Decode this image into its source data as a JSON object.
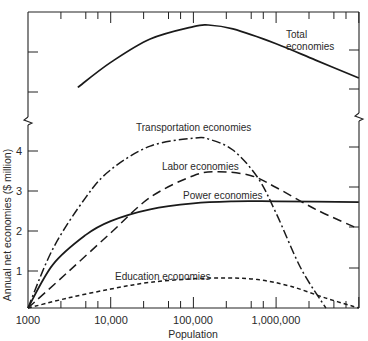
{
  "chart_data": {
    "type": "line",
    "title": "",
    "xlabel": "Population",
    "ylabel": "Annual net economies ($ million)",
    "x_scale": "log",
    "xlim": [
      1000,
      10000000
    ],
    "ylim": [
      0,
      4.5
    ],
    "x_ticks": [
      {
        "value": 1000,
        "label": "1000"
      },
      {
        "value": 10000,
        "label": "10,000"
      },
      {
        "value": 100000,
        "label": "100,000"
      },
      {
        "value": 1000000,
        "label": "1,000,000"
      }
    ],
    "y_ticks": [
      {
        "value": 1,
        "label": "1"
      },
      {
        "value": 2,
        "label": "2"
      },
      {
        "value": 3,
        "label": "3"
      },
      {
        "value": 4,
        "label": "4"
      }
    ],
    "axis_break": "y-axis broken above 4.5; upper panel shows Total economies on an unlabeled compressed scale",
    "grid": false,
    "legend": "inline labels",
    "series": [
      {
        "name": "Transportation economies",
        "style": "dash-dot",
        "x": [
          1000,
          2000,
          5000,
          10000,
          30000,
          100000,
          150000,
          300000,
          600000,
          1000000,
          2000000,
          4000000
        ],
        "y": [
          0,
          1.5,
          2.8,
          3.5,
          4.1,
          4.3,
          4.28,
          4.0,
          3.3,
          2.4,
          1.0,
          0
        ]
      },
      {
        "name": "Labor economies",
        "style": "long-dash",
        "x": [
          1000,
          3000,
          10000,
          30000,
          100000,
          200000,
          500000,
          1000000,
          3000000,
          10000000
        ],
        "y": [
          0,
          0.9,
          1.9,
          2.8,
          3.35,
          3.45,
          3.35,
          3.05,
          2.5,
          2.0
        ]
      },
      {
        "name": "Power economies",
        "style": "solid",
        "x": [
          1000,
          2000,
          5000,
          10000,
          30000,
          100000,
          300000,
          1000000,
          10000000
        ],
        "y": [
          0,
          1.1,
          1.85,
          2.2,
          2.5,
          2.65,
          2.7,
          2.7,
          2.68
        ]
      },
      {
        "name": "Education economies",
        "style": "short-dash",
        "x": [
          1000,
          3000,
          10000,
          30000,
          100000,
          250000,
          600000,
          1500000,
          4000000,
          10000000
        ],
        "y": [
          0,
          0.25,
          0.48,
          0.65,
          0.74,
          0.76,
          0.72,
          0.55,
          0.25,
          0
        ]
      },
      {
        "name": "Total economies",
        "style": "solid",
        "panel": "upper (relative scale, unlabeled)",
        "x": [
          4000,
          10000,
          30000,
          100000,
          150000,
          300000,
          1000000,
          3000000,
          10000000
        ],
        "y_relative": [
          0.2,
          0.52,
          0.82,
          0.98,
          1.0,
          0.95,
          0.76,
          0.55,
          0.32
        ]
      }
    ]
  },
  "labels": {
    "total_line1": "Total",
    "total_line2": "economies",
    "transportation": "Transportation economies",
    "labor": "Labor economies",
    "power": "Power economies",
    "education": "Education economies",
    "xlabel": "Population",
    "ylabel": "Annual net economies ($ million)",
    "xt0": "1000",
    "xt1": "10,000",
    "xt2": "100,000",
    "xt3": "1,000,000",
    "yt1": "1",
    "yt2": "2",
    "yt3": "3",
    "yt4": "4"
  }
}
